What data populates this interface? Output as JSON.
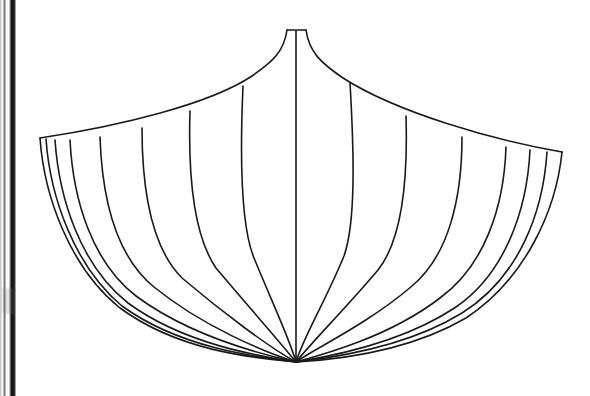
{
  "page": {
    "background_color": "#ffffff",
    "width": 590,
    "height": 396
  },
  "scan_artifacts": {
    "binding_edge_label": "page-binding-shadow",
    "binding_edge_color": "#0b0b0b",
    "smudge_label": "scan-smudge"
  },
  "drawing": {
    "name": "fan-shell-outline",
    "stroke_color": "#1a1a1a",
    "fill_color": "#ffffff",
    "stroke_width": 1.6,
    "apex": {
      "x": 296,
      "y": 30
    },
    "apex_cap_left": {
      "x": 287,
      "y": 30
    },
    "apex_cap_right": {
      "x": 306,
      "y": 30
    },
    "left_tip": {
      "x": 40,
      "y": 138
    },
    "right_tip": {
      "x": 562,
      "y": 152
    },
    "bottom_point": {
      "x": 296,
      "y": 362
    },
    "center_spine": "M 296 31 L 296 362",
    "top_edge_left": "M 287 30 C 284 52 272 62 252 76 C 210 104 120 126 40 138",
    "top_edge_right": "M 306 30 C 309 52 321 63 343 78 C 396 112 492 140 562 152",
    "outer_left": "M 40 138 C 44 196 70 268 120 308 C 180 352 256 358 296 362",
    "outer_right": "M 562 152 C 556 212 524 280 466 318 C 404 354 330 360 296 362",
    "ribs_left": [
      {
        "id": "rib-L1",
        "d": "M 46 139 C 50 196 74 266 122 306 C 180 348 256 357 296 362"
      },
      {
        "id": "rib-L2",
        "d": "M 55 140 C 59 198 80 265 128 303 C 184 344 258 356 296 362"
      },
      {
        "id": "rib-L3",
        "d": "M 70 140 C 73 200 92 262 136 296 C 190 336 260 354 296 362"
      },
      {
        "id": "rib-L4",
        "d": "M 100 137 C 102 198 116 256 154 287 C 202 326 264 352 296 362"
      },
      {
        "id": "rib-L5",
        "d": "M 142 128 C 142 190 152 248 182 278 C 222 312 270 348 296 362"
      },
      {
        "id": "rib-L6",
        "d": "M 190 111 C 188 176 194 236 216 268 C 248 306 280 342 296 362"
      },
      {
        "id": "rib-L7",
        "d": "M 243 86 C 240 154 240 224 254 258 C 272 302 290 340 296 362"
      }
    ],
    "ribs_right": [
      {
        "id": "rib-R1",
        "d": "M 350 83 C 354 152 356 222 344 256 C 326 300 302 340 296 362"
      },
      {
        "id": "rib-R2",
        "d": "M 406 116 C 408 182 402 240 378 270 C 346 308 310 344 296 362"
      },
      {
        "id": "rib-R3",
        "d": "M 462 137 C 462 200 448 256 412 286 C 368 324 312 350 296 362"
      },
      {
        "id": "rib-R4",
        "d": "M 506 147 C 504 208 484 266 440 298 C 388 338 318 356 296 362"
      },
      {
        "id": "rib-R5",
        "d": "M 530 150 C 527 212 504 274 456 307 C 398 346 320 358 296 362"
      },
      {
        "id": "rib-R6",
        "d": "M 547 152 C 543 214 518 278 462 313 C 402 350 322 359 296 362"
      }
    ]
  }
}
